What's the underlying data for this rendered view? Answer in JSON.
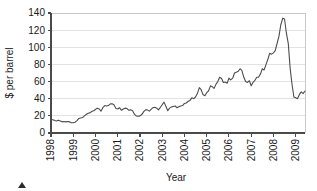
{
  "chart_data": {
    "type": "line",
    "title": "",
    "subtitle": "",
    "xlabel": "Year",
    "ylabel": "$ per barrel",
    "xlim": [
      1998,
      2009.42
    ],
    "ylim": [
      0,
      140
    ],
    "grid": true,
    "legend": null,
    "x_tick_labels": [
      "1998",
      "1999",
      "2000",
      "2001",
      "2002",
      "2003",
      "2004",
      "2005",
      "2006",
      "2007",
      "2008",
      "2009"
    ],
    "x_tick_values": [
      1998,
      1999,
      2000,
      2001,
      2002,
      2003,
      2004,
      2005,
      2006,
      2007,
      2008,
      2009
    ],
    "y_tick_labels": [
      "0",
      "20",
      "40",
      "60",
      "80",
      "100",
      "120",
      "140"
    ],
    "y_tick_values": [
      0,
      20,
      40,
      60,
      80,
      100,
      120,
      140
    ],
    "series": [
      {
        "name": "Crude oil price",
        "color": "#4d4d4d",
        "x": [
          1998.0,
          1998.08,
          1998.17,
          1998.25,
          1998.33,
          1998.42,
          1998.5,
          1998.58,
          1998.67,
          1998.75,
          1998.83,
          1998.92,
          1999.0,
          1999.08,
          1999.17,
          1999.25,
          1999.33,
          1999.42,
          1999.5,
          1999.58,
          1999.67,
          1999.75,
          1999.83,
          1999.92,
          2000.0,
          2000.08,
          2000.17,
          2000.25,
          2000.33,
          2000.42,
          2000.5,
          2000.58,
          2000.67,
          2000.75,
          2000.83,
          2000.92,
          2001.0,
          2001.08,
          2001.17,
          2001.25,
          2001.33,
          2001.42,
          2001.5,
          2001.58,
          2001.67,
          2001.75,
          2001.83,
          2001.92,
          2002.0,
          2002.08,
          2002.17,
          2002.25,
          2002.33,
          2002.42,
          2002.5,
          2002.58,
          2002.67,
          2002.75,
          2002.83,
          2002.92,
          2003.0,
          2003.08,
          2003.17,
          2003.25,
          2003.33,
          2003.42,
          2003.5,
          2003.58,
          2003.67,
          2003.75,
          2003.83,
          2003.92,
          2004.0,
          2004.08,
          2004.17,
          2004.25,
          2004.33,
          2004.42,
          2004.5,
          2004.58,
          2004.67,
          2004.75,
          2004.83,
          2004.92,
          2005.0,
          2005.08,
          2005.17,
          2005.25,
          2005.33,
          2005.42,
          2005.5,
          2005.58,
          2005.67,
          2005.75,
          2005.83,
          2005.92,
          2006.0,
          2006.08,
          2006.17,
          2006.25,
          2006.33,
          2006.42,
          2006.5,
          2006.58,
          2006.67,
          2006.75,
          2006.83,
          2006.92,
          2007.0,
          2007.08,
          2007.17,
          2007.25,
          2007.33,
          2007.42,
          2007.5,
          2007.58,
          2007.67,
          2007.75,
          2007.83,
          2007.92,
          2008.0,
          2008.08,
          2008.17,
          2008.25,
          2008.33,
          2008.42,
          2008.5,
          2008.58,
          2008.67,
          2008.75,
          2008.83,
          2008.92,
          2009.0,
          2009.08,
          2009.17,
          2009.25,
          2009.33,
          2009.42
        ],
        "y": [
          16.0,
          15.5,
          14.5,
          14.0,
          15.0,
          14.0,
          13.0,
          13.5,
          13.0,
          13.5,
          13.0,
          12.0,
          12.0,
          12.5,
          14.5,
          17.0,
          17.5,
          18.0,
          20.0,
          21.5,
          23.0,
          23.5,
          25.0,
          26.0,
          27.5,
          29.0,
          28.0,
          25.5,
          29.5,
          32.0,
          31.5,
          32.0,
          34.0,
          34.0,
          33.0,
          28.5,
          28.0,
          29.5,
          26.5,
          28.0,
          29.0,
          28.5,
          26.5,
          27.0,
          26.0,
          22.0,
          20.0,
          19.5,
          20.0,
          21.5,
          25.0,
          27.0,
          27.0,
          25.5,
          27.5,
          29.5,
          30.0,
          29.0,
          27.0,
          30.0,
          33.0,
          36.0,
          31.0,
          26.0,
          29.0,
          30.5,
          31.0,
          31.5,
          29.5,
          30.5,
          31.5,
          32.0,
          34.5,
          35.0,
          37.0,
          38.0,
          41.0,
          40.0,
          42.0,
          46.0,
          53.0,
          50.5,
          45.0,
          43.5,
          47.0,
          49.0,
          55.0,
          54.0,
          52.0,
          57.0,
          60.0,
          65.0,
          63.5,
          59.0,
          59.5,
          58.0,
          64.0,
          62.0,
          64.0,
          70.0,
          71.0,
          72.0,
          75.0,
          73.0,
          65.0,
          60.0,
          59.0,
          61.0,
          55.0,
          59.0,
          61.5,
          65.0,
          65.0,
          69.0,
          75.0,
          73.5,
          80.0,
          86.0,
          93.0,
          92.0,
          93.5,
          96.0,
          105.0,
          113.0,
          126.0,
          134.0,
          133.0,
          117.0,
          104.0,
          76.0,
          58.0,
          42.0,
          41.0,
          40.0,
          45.0,
          48.0,
          46.0,
          49.0
        ]
      }
    ]
  },
  "annotations": {
    "corner_marker": "triangle-marker"
  }
}
